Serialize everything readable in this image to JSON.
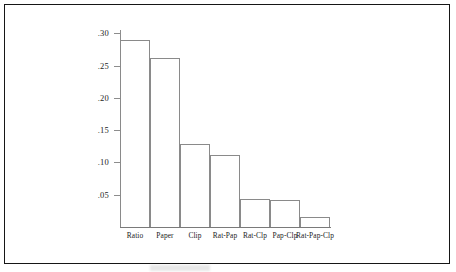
{
  "figure": {
    "background_color": "#ffffff",
    "frame_color": "#161616",
    "axis_color": "#8a8a8a"
  },
  "chart_data": {
    "type": "bar",
    "title": "",
    "subtitle": "",
    "xlabel": "",
    "ylabel": "",
    "categories": [
      "Ratio",
      "Paper",
      "Clip",
      "Rat-Pap",
      "Rat-Clp",
      "Pap-Clp",
      "Rat-Pap-Clp"
    ],
    "values": [
      0.289,
      0.261,
      0.129,
      0.112,
      0.044,
      0.042,
      0.015
    ],
    "ylim": [
      0,
      0.305
    ],
    "yticks": [
      0.3,
      0.25,
      0.2,
      0.15,
      0.1,
      0.05
    ],
    "ytick_labels": [
      ".30",
      ".25",
      ".20",
      ".15",
      ".10",
      ".05"
    ],
    "grid": false,
    "legend": null,
    "bar_fill": "#ffffff",
    "bar_edge": "#8a8a8a"
  }
}
